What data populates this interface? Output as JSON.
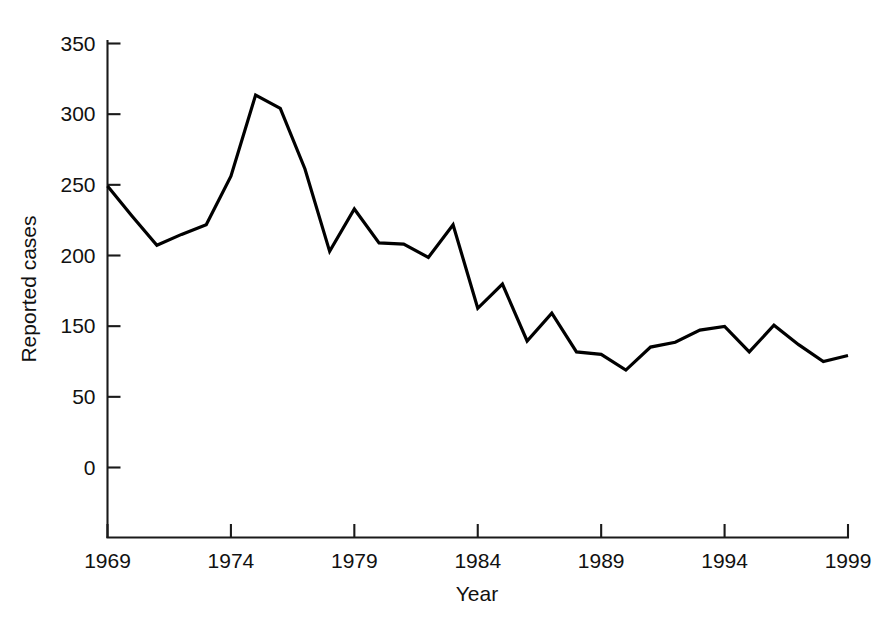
{
  "chart_data": {
    "type": "line",
    "title": "",
    "subtitle": "",
    "xlabel": "Year",
    "ylabel": "Reported cases",
    "xlim": [
      1969,
      1999
    ],
    "ylim": [
      0,
      350
    ],
    "grid": false,
    "legend": null,
    "legend_position": "none",
    "x_tick_labels": [
      "1969",
      "1974",
      "1979",
      "1984",
      "1989",
      "1994",
      "1999"
    ],
    "x_ticks": [
      1969,
      1974,
      1979,
      1984,
      1989,
      1994,
      1999
    ],
    "y_tick_labels": [
      "0",
      "50",
      "150",
      "200",
      "250",
      "300",
      "350"
    ],
    "y_ticks": [
      0,
      50,
      150,
      200,
      250,
      300,
      350
    ],
    "y_tick_note": "Axis printed with seven evenly spaced ticks; the label between 0 and 150 reads 50 as printed.",
    "x": [
      1969,
      1970,
      1971,
      1972,
      1973,
      1974,
      1975,
      1976,
      1977,
      1978,
      1979,
      1980,
      1981,
      1982,
      1983,
      1984,
      1985,
      1986,
      1987,
      1988,
      1989,
      1990,
      1991,
      1992,
      1993,
      1994,
      1995,
      1996,
      1997,
      1998,
      1999
    ],
    "values": [
      232,
      207,
      183,
      192,
      200,
      240,
      307,
      296,
      246,
      178,
      213,
      185,
      184,
      173,
      200,
      131,
      151,
      104,
      127,
      95,
      93,
      80,
      99,
      103,
      113,
      116,
      95,
      117,
      101,
      87,
      92
    ],
    "categories": [
      "1969",
      "1970",
      "1971",
      "1972",
      "1973",
      "1974",
      "1975",
      "1976",
      "1977",
      "1978",
      "1979",
      "1980",
      "1981",
      "1982",
      "1983",
      "1984",
      "1985",
      "1986",
      "1987",
      "1988",
      "1989",
      "1990",
      "1991",
      "1992",
      "1993",
      "1994",
      "1995",
      "1996",
      "1997",
      "1998",
      "1999"
    ],
    "series": [
      {
        "name": "Reported cases",
        "values": [
          232,
          207,
          183,
          192,
          200,
          240,
          307,
          296,
          246,
          178,
          213,
          185,
          184,
          173,
          200,
          131,
          151,
          104,
          127,
          95,
          93,
          80,
          99,
          103,
          113,
          116,
          95,
          117,
          101,
          87,
          92
        ],
        "color": "#000000"
      }
    ],
    "line_color": "#000000"
  }
}
